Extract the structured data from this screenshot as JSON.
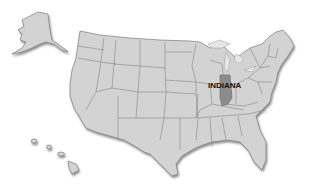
{
  "map": {
    "title": "United States",
    "highlighted_state": "Indiana",
    "label": "INDIANA",
    "colors": {
      "background": "#ffffff",
      "state_fill": "#d3d3d3",
      "state_border": "#6a6a6a",
      "highlight_fill": "#8c8c8c",
      "label_text": "#111111"
    },
    "regions": [
      "Alaska",
      "Hawaii",
      "Contiguous United States"
    ]
  }
}
